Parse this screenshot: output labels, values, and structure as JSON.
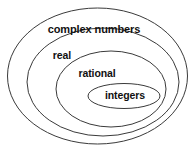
{
  "diagram": {
    "title": "complex numbers",
    "type": "nested-sets-euler-diagram",
    "background_color": "#ffffff",
    "stroke_color": "#3a3a3a",
    "text_color": "#111111",
    "sets": [
      {
        "id": "complex",
        "label": "complex numbers",
        "level": 0,
        "cx": 97.5,
        "cy": 76,
        "rx": 90,
        "ry": 68,
        "label_x": 94,
        "label_y": 30
      },
      {
        "id": "real",
        "label": "real",
        "level": 1,
        "cx": 103,
        "cy": 82,
        "rx": 76,
        "ry": 54,
        "label_x": 62,
        "label_y": 56
      },
      {
        "id": "rational",
        "label": "rational",
        "level": 2,
        "cx": 111,
        "cy": 89,
        "rx": 55,
        "ry": 38,
        "label_x": 97,
        "label_y": 74
      },
      {
        "id": "integers",
        "label": "integers",
        "level": 3,
        "cx": 124,
        "cy": 96,
        "rx": 36,
        "ry": 12.5,
        "label_x": 125,
        "label_y": 96
      }
    ]
  }
}
